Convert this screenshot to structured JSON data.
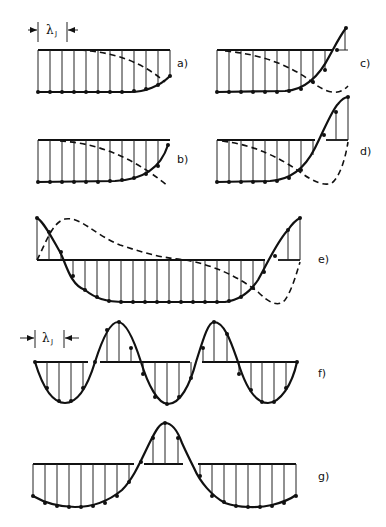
{
  "figure": {
    "spacing_label": "λ",
    "spacing_subscript": "J",
    "panels": [
      {
        "id": "a",
        "label": "a)"
      },
      {
        "id": "b",
        "label": "b)"
      },
      {
        "id": "c",
        "label": "c)"
      },
      {
        "id": "d",
        "label": "d)"
      },
      {
        "id": "e",
        "label": "e)"
      },
      {
        "id": "f",
        "label": "f)"
      },
      {
        "id": "g",
        "label": "g)"
      }
    ],
    "legend": {
      "solid_curve": "mode amplitude with lattice sample points",
      "dashed_curve": "complementary / derivative profile"
    }
  }
}
